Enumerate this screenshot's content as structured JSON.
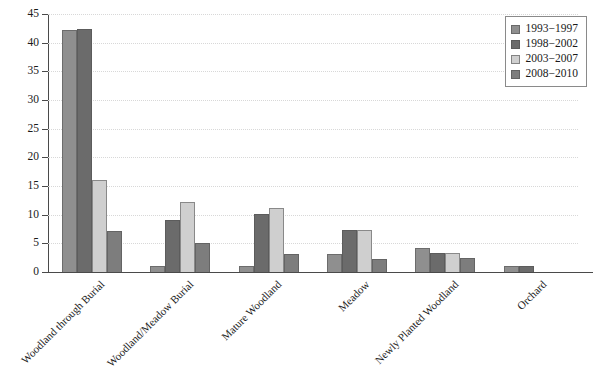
{
  "chart_data": {
    "type": "bar",
    "title": "",
    "subtitle": "",
    "xlabel": "",
    "ylabel": "",
    "ylim": [
      0,
      45
    ],
    "ytick_step": 5,
    "yticks": [
      0,
      5,
      10,
      15,
      20,
      25,
      30,
      35,
      40,
      45
    ],
    "ytick_labels": [
      "0",
      "5",
      "10",
      "15",
      "20",
      "25",
      "30",
      "35",
      "40",
      "45"
    ],
    "grid": true,
    "grid_style": "dotted-horizontal",
    "legend_position": "top-right",
    "categories": [
      "Woodland through Burial",
      "Woodland/Meadow Burial",
      "Mature Woodland",
      "Meadow",
      "Newly Planted Woodland",
      "Orchard"
    ],
    "series": [
      {
        "name": "1993−1997",
        "color": "#8f8f8f",
        "values": [
          42.2,
          1.0,
          1.1,
          3.2,
          4.2,
          1.1
        ]
      },
      {
        "name": "1998−2002",
        "color": "#6b6b6b",
        "values": [
          42.3,
          9.1,
          10.2,
          7.4,
          3.4,
          1.1
        ]
      },
      {
        "name": "2003−2007",
        "color": "#cfcfcf",
        "values": [
          16.1,
          12.2,
          11.2,
          7.4,
          3.4,
          0
        ]
      },
      {
        "name": "2008−2010",
        "color": "#7d7d7d",
        "values": [
          7.1,
          5.1,
          3.1,
          2.2,
          2.4,
          0
        ]
      }
    ]
  },
  "legend": {
    "items": [
      {
        "label": "1993−1997"
      },
      {
        "label": "1998−2002"
      },
      {
        "label": "2003−2007"
      },
      {
        "label": "2008−2010"
      }
    ]
  }
}
